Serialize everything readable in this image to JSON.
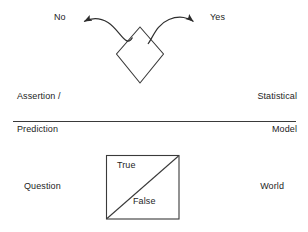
{
  "figure": {
    "background_color": "#ffffff",
    "stroke_color": "#333333",
    "text_color": "#1d1d1d",
    "top_panel": {
      "decision_shape": "diamond",
      "branches": [
        {
          "label": "No",
          "direction": "left"
        },
        {
          "label": "Yes",
          "direction": "right"
        }
      ],
      "left_caption_line1": "Assertion /",
      "left_caption_line2": "Prediction",
      "right_caption_line1": "Statistical",
      "right_caption_line2": "Model"
    },
    "divider": {
      "name": "horizontal-rule"
    },
    "bottom_panel": {
      "shape": "square-with-diagonal",
      "upper_label": "True",
      "lower_label": "False",
      "left_caption": "Question",
      "right_caption": "World"
    }
  }
}
